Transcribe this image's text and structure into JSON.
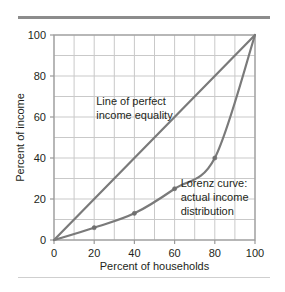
{
  "figure": {
    "background_color": "#ffffff",
    "top_rule_color": "#8c8c8c",
    "bottom_rule_color": "#cfcfcf"
  },
  "chart_data": {
    "type": "line",
    "title": "",
    "xlabel": "Percent of households",
    "ylabel": "Percent of income",
    "xlim": [
      0,
      100
    ],
    "ylim": [
      0,
      100
    ],
    "xticks": [
      "0",
      "20",
      "40",
      "60",
      "80",
      "100"
    ],
    "yticks": [
      "0",
      "20",
      "40",
      "60",
      "80",
      "100"
    ],
    "xtick_values": [
      0,
      20,
      40,
      60,
      80,
      100
    ],
    "ytick_values": [
      0,
      20,
      40,
      60,
      80,
      100
    ],
    "grid": true,
    "grid_step": 10,
    "grid_color": "#c9c9c9",
    "axis_color": "#9a9a9a",
    "legend": "none",
    "series": [
      {
        "name": "Line of perfect income equality",
        "color": "#7a7a7a",
        "markers": false,
        "x": [
          0,
          100
        ],
        "values": [
          0,
          100
        ]
      },
      {
        "name": "Lorenz curve: actual income distribution",
        "color": "#7a7a7a",
        "markers": true,
        "x": [
          0,
          20,
          40,
          60,
          80,
          100
        ],
        "values": [
          0,
          6,
          13,
          25,
          40,
          100
        ]
      }
    ],
    "annotations": [
      {
        "name": "equality-line-label",
        "lines": [
          "Line of perfect",
          "income equality"
        ],
        "x": 21,
        "y": 66
      },
      {
        "name": "lorenz-curve-label",
        "lines": [
          "Lorenz curve:",
          "actual income",
          "distribution"
        ],
        "x": 63,
        "y": 26
      }
    ]
  }
}
